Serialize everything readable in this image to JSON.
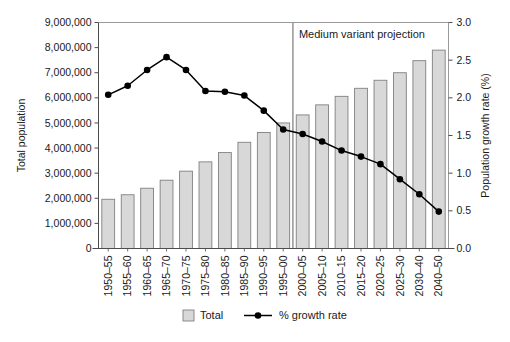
{
  "chart_data": {
    "type": "bar",
    "title": "",
    "xlabel": "",
    "ylabel": "Total population",
    "y2label": "Population growth rate (%)",
    "ylim": [
      0,
      9000000
    ],
    "y2lim": [
      0.0,
      3.0
    ],
    "yticks": [
      "0",
      "1,000,000",
      "2,000,000",
      "3,000,000",
      "4,000,000",
      "5,000,000",
      "6,000,000",
      "7,000,000",
      "8,000,000",
      "9,000,000"
    ],
    "ytick_values": [
      0,
      1000000,
      2000000,
      3000000,
      4000000,
      5000000,
      6000000,
      7000000,
      8000000,
      9000000
    ],
    "y2ticks": [
      "0.0",
      "0.5",
      "1.0",
      "1.5",
      "2.0",
      "2.5",
      "3.0"
    ],
    "y2tick_values": [
      0.0,
      0.5,
      1.0,
      1.5,
      2.0,
      2.5,
      3.0
    ],
    "grid": false,
    "legend_position": "bottom",
    "categories": [
      "1950–55",
      "1955–60",
      "1960–65",
      "1965–70",
      "1970–75",
      "1975–80",
      "1980–85",
      "1985–90",
      "1990–95",
      "1995–00",
      "2000–05",
      "2005–10",
      "2010–15",
      "2015–20",
      "2020–25",
      "2025–30",
      "2030–40",
      "2040–50"
    ],
    "series": [
      {
        "name": "Total",
        "kind": "bar",
        "axis": "left",
        "color": "#d8d8d8",
        "edge_color": "#808080",
        "values": [
          1960000,
          2140000,
          2400000,
          2720000,
          3080000,
          3450000,
          3820000,
          4230000,
          4620000,
          5000000,
          5320000,
          5720000,
          6060000,
          6380000,
          6700000,
          7000000,
          7480000,
          7900000
        ]
      },
      {
        "name": "% growth rate",
        "kind": "line",
        "axis": "right",
        "color": "#000000",
        "marker": "circle",
        "values": [
          2.04,
          2.16,
          2.37,
          2.54,
          2.37,
          2.09,
          2.08,
          2.03,
          1.83,
          1.58,
          1.52,
          1.42,
          1.3,
          1.22,
          1.12,
          0.92,
          0.72,
          0.49
        ]
      }
    ],
    "annotations": [
      {
        "text": "Medium variant projection",
        "type": "divider-label",
        "divider_after_category": "1995–00"
      }
    ]
  },
  "legend": {
    "items": [
      {
        "label": "Total",
        "marker": "bar-swatch"
      },
      {
        "label": "% growth rate",
        "marker": "line-dot"
      }
    ]
  }
}
